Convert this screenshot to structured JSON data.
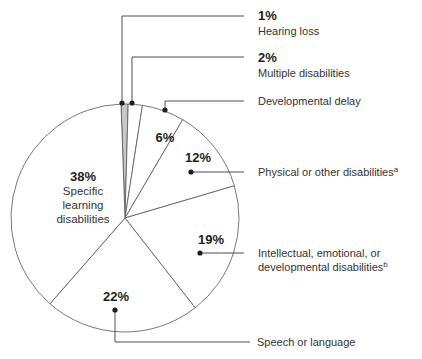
{
  "chart_data": {
    "type": "pie",
    "title": "",
    "start_angle_deg": -2,
    "direction": "clockwise",
    "slices": [
      {
        "label": "Hearing loss",
        "value": 1,
        "pct_label": "1%",
        "sup": "",
        "color": "#c8c8c8"
      },
      {
        "label": "Multiple disabilities",
        "value": 2,
        "pct_label": "2%",
        "sup": "",
        "color": "#ffffff"
      },
      {
        "label": "Developmental delay",
        "value": 6,
        "pct_label": "6%",
        "sup": "",
        "color": "#ffffff"
      },
      {
        "label": "Physical or other disabilities",
        "value": 12,
        "pct_label": "12%",
        "sup": "a",
        "color": "#ffffff"
      },
      {
        "label": "Intellectual, emotional, or developmental disabilities",
        "value": 19,
        "pct_label": "19%",
        "sup": "b",
        "color": "#ffffff"
      },
      {
        "label": "Speech or language",
        "value": 22,
        "pct_label": "22%",
        "sup": "",
        "color": "#ffffff"
      },
      {
        "label": "Specific learning disabilities",
        "value": 38,
        "pct_label": "38%",
        "sup": "",
        "color": "#ffffff"
      }
    ],
    "labels": {
      "hearing_pct": "1%",
      "hearing": "Hearing loss",
      "multiple_pct": "2%",
      "multiple": "Multiple disabilities",
      "devdelay": "Developmental delay",
      "devdelay_pct": "6%",
      "physical_pct": "12%",
      "physical": "Physical or other disabilities",
      "physical_sup": "a",
      "intellectual_pct": "19%",
      "intellectual_line1": "Intellectual, emotional, or",
      "intellectual_line2": "developmental disabilities",
      "intellectual_sup": "b",
      "speech_pct": "22%",
      "speech": "Speech or language",
      "sld_pct": "38%",
      "sld_line1": "Specific",
      "sld_line2": "learning",
      "sld_line3": "disabilities"
    },
    "colors": {
      "stroke": "#555555",
      "leader": "#3a3a3a",
      "highlight": "#c8c8c8"
    }
  }
}
